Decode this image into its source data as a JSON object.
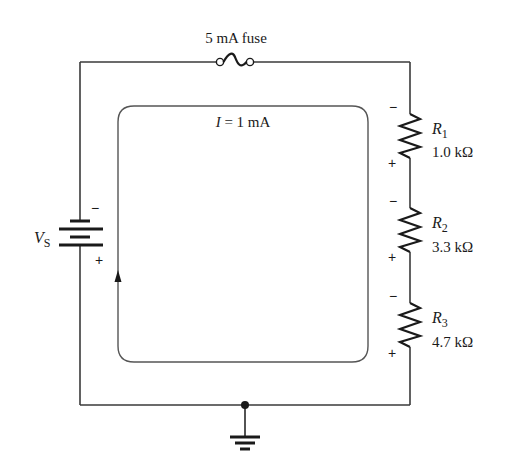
{
  "diagram": {
    "type": "series circuit schematic",
    "fuse": {
      "label": "5 mA fuse"
    },
    "source": {
      "label_main": "V",
      "label_sub": "S",
      "neg_sign": "−",
      "pos_sign": "+"
    },
    "current": {
      "label_var": "I",
      "label_rest": " = 1 mA",
      "direction": "clockwise (upward on left side)"
    },
    "resistors": [
      {
        "name_main": "R",
        "name_sub": "1",
        "value": "1.0 kΩ",
        "top_sign": "−",
        "bottom_sign": "+"
      },
      {
        "name_main": "R",
        "name_sub": "2",
        "value": "3.3 kΩ",
        "top_sign": "−",
        "bottom_sign": "+"
      },
      {
        "name_main": "R",
        "name_sub": "3",
        "value": "4.7 kΩ",
        "top_sign": "−",
        "bottom_sign": "+"
      }
    ],
    "ground": {
      "symbol": "ground"
    },
    "colors": {
      "wire": "#3a3a3a",
      "loop": "#555555",
      "text": "#1a1a1a"
    }
  }
}
